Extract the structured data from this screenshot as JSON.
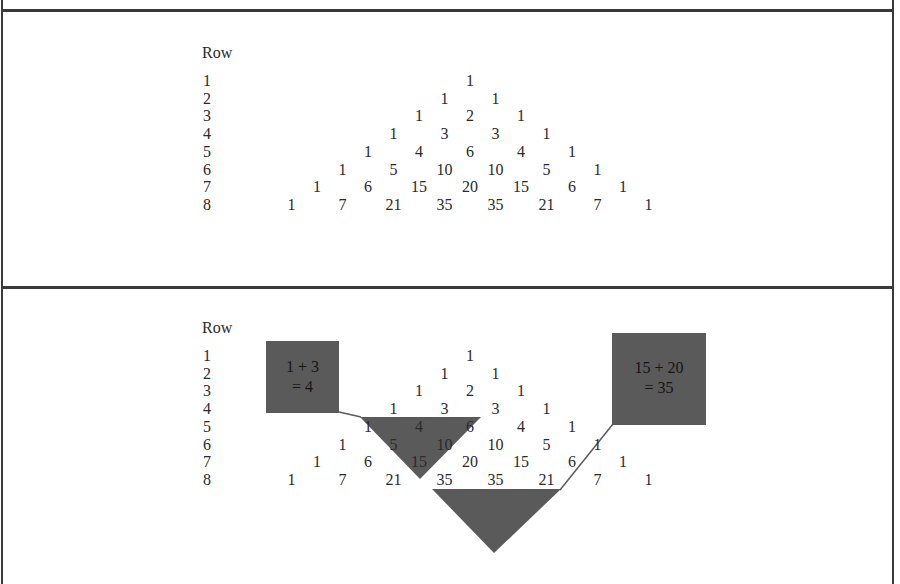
{
  "panels": [
    {
      "id": "plain",
      "header": "Row",
      "rows": [
        {
          "label": "1",
          "values": [
            "1"
          ]
        },
        {
          "label": "2",
          "values": [
            "1",
            "1"
          ]
        },
        {
          "label": "3",
          "values": [
            "1",
            "2",
            "1"
          ]
        },
        {
          "label": "4",
          "values": [
            "1",
            "3",
            "3",
            "1"
          ]
        },
        {
          "label": "5",
          "values": [
            "1",
            "4",
            "6",
            "4",
            "1"
          ]
        },
        {
          "label": "6",
          "values": [
            "1",
            "5",
            "10",
            "10",
            "5",
            "1"
          ]
        },
        {
          "label": "7",
          "values": [
            "1",
            "6",
            "15",
            "20",
            "15",
            "6",
            "1"
          ]
        },
        {
          "label": "8",
          "values": [
            "1",
            "7",
            "21",
            "35",
            "35",
            "21",
            "7",
            "1"
          ]
        }
      ]
    },
    {
      "id": "annotated",
      "header": "Row",
      "rows": [
        {
          "label": "1",
          "values": [
            "1"
          ]
        },
        {
          "label": "2",
          "values": [
            "1",
            "1"
          ]
        },
        {
          "label": "3",
          "values": [
            "1",
            "2",
            "1"
          ]
        },
        {
          "label": "4",
          "values": [
            "1",
            "3",
            "3",
            "1"
          ]
        },
        {
          "label": "5",
          "values": [
            "1",
            "4",
            "6",
            "4",
            "1"
          ]
        },
        {
          "label": "6",
          "values": [
            "1",
            "5",
            "10",
            "10",
            "5",
            "1"
          ]
        },
        {
          "label": "7",
          "values": [
            "1",
            "6",
            "15",
            "20",
            "15",
            "6",
            "1"
          ]
        },
        {
          "label": "8",
          "values": [
            "1",
            "7",
            "21",
            "35",
            "35",
            "21",
            "7",
            "1"
          ]
        }
      ],
      "callouts": [
        {
          "line1": "1 + 3",
          "line2": "= 4"
        },
        {
          "line1": "15 + 20",
          "line2": "= 35"
        }
      ]
    }
  ],
  "colors": {
    "highlight": "#5a5a5a",
    "border": "#3a3a3a",
    "text": "#2a2a2a"
  }
}
